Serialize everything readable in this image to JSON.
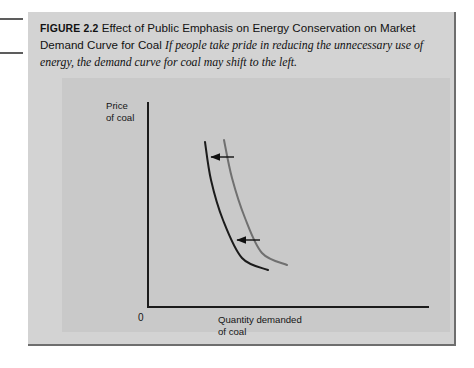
{
  "figure": {
    "label": "FIGURE 2.2",
    "title": "Effect of Public Emphasis on Energy Conservation on Market Demand Curve for Coal",
    "description": "If people take pride in reducing the unnecessary use of energy, the demand curve for coal may shift to the left."
  },
  "chart_data": {
    "type": "line",
    "title": "Effect of Public Emphasis on Energy Conservation on Market Demand Curve for Coal",
    "xlabel": "Quantity demanded of coal",
    "ylabel": "Price of coal",
    "xlabel_lines": "Quantity demanded\nof coal",
    "ylabel_lines": "Price\nof coal",
    "origin_label": "0",
    "grid": false,
    "legend": "none",
    "axis_ticks": [],
    "series": [
      {
        "name": "Original demand curve",
        "color": "#707070",
        "note": "right curve",
        "points": [
          [
            162,
            62
          ],
          [
            170,
            100
          ],
          [
            183,
            140
          ],
          [
            200,
            175
          ],
          [
            225,
            187
          ]
        ]
      },
      {
        "name": "New demand curve after conservation",
        "color": "#1b1b1b",
        "note": "left curve, shifted to the left",
        "points": [
          [
            143,
            64
          ],
          [
            149,
            102
          ],
          [
            161,
            142
          ],
          [
            180,
            180
          ],
          [
            206,
            192
          ]
        ]
      }
    ],
    "annotations": [
      {
        "type": "arrow",
        "direction": "left",
        "name": "shift-arrow-upper",
        "from": [
          172,
          79
        ],
        "to": [
          149,
          79
        ]
      },
      {
        "type": "arrow",
        "direction": "left",
        "name": "shift-arrow-lower",
        "from": [
          198,
          162
        ],
        "to": [
          175,
          162
        ]
      }
    ]
  }
}
